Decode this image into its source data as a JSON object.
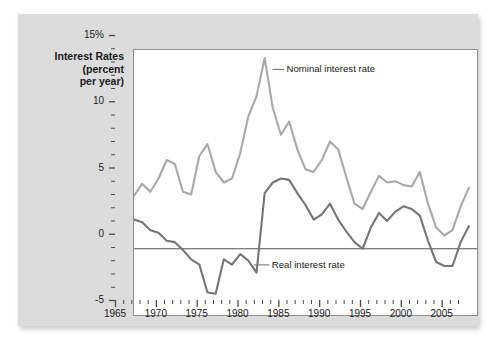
{
  "chart_data": {
    "type": "line",
    "title": "",
    "ylabel": "Interest Rates (percent per year)",
    "ylabel_lines": [
      "Interest Rates",
      "(percent",
      "per year)"
    ],
    "xlabel": "",
    "xlim": [
      1965,
      2007
    ],
    "ylim": [
      -5,
      15
    ],
    "grid": false,
    "legend_position": "inline-annotation",
    "y_ticks": [
      {
        "value": 15,
        "label": "15%"
      },
      {
        "value": 10,
        "label": "10"
      },
      {
        "value": 5,
        "label": "5"
      },
      {
        "value": 0,
        "label": "0"
      },
      {
        "value": -5,
        "label": "-5"
      }
    ],
    "y_minor_tick_step": 1,
    "x_ticks": [
      {
        "value": 1965,
        "label": "1965"
      },
      {
        "value": 1970,
        "label": "1970"
      },
      {
        "value": 1975,
        "label": "1975"
      },
      {
        "value": 1980,
        "label": "1980"
      },
      {
        "value": 1985,
        "label": "1985"
      },
      {
        "value": 1990,
        "label": "1990"
      },
      {
        "value": 1995,
        "label": "1995"
      },
      {
        "value": 2000,
        "label": "2000"
      },
      {
        "value": 2005,
        "label": "2005"
      }
    ],
    "x_minor_tick_step": 1,
    "zero_line": 0,
    "x": [
      1965,
      1966,
      1967,
      1968,
      1969,
      1970,
      1971,
      1972,
      1973,
      1974,
      1975,
      1976,
      1977,
      1978,
      1979,
      1980,
      1981,
      1982,
      1983,
      1984,
      1985,
      1986,
      1987,
      1988,
      1989,
      1990,
      1991,
      1992,
      1993,
      1994,
      1995,
      1996,
      1997,
      1998,
      1999,
      2000,
      2001,
      2002,
      2003,
      2004,
      2005,
      2006
    ],
    "series": [
      {
        "name": "Nominal interest rate",
        "color": "#a9a9a9",
        "values": [
          4.0,
          4.9,
          4.3,
          5.3,
          6.7,
          6.4,
          4.3,
          4.1,
          7.0,
          7.9,
          5.8,
          5.0,
          5.3,
          7.2,
          10.0,
          11.5,
          14.4,
          10.6,
          8.6,
          9.6,
          7.5,
          6.0,
          5.8,
          6.7,
          8.1,
          7.5,
          5.4,
          3.4,
          3.0,
          4.3,
          5.5,
          5.0,
          5.1,
          4.8,
          4.7,
          5.8,
          3.4,
          1.6,
          1.0,
          1.4,
          3.2,
          4.6
        ],
        "label_text": "Nominal interest rate"
      },
      {
        "name": "Real interest rate",
        "color": "#767676",
        "values": [
          2.2,
          2.0,
          1.4,
          1.2,
          0.6,
          0.5,
          -0.1,
          -0.8,
          -1.2,
          -3.3,
          -3.4,
          -0.8,
          -1.2,
          -0.4,
          -0.9,
          -1.8,
          4.2,
          5.0,
          5.3,
          5.2,
          4.2,
          3.3,
          2.2,
          2.6,
          3.4,
          2.2,
          1.3,
          0.5,
          0.0,
          1.6,
          2.7,
          2.1,
          2.8,
          3.2,
          3.0,
          2.5,
          0.6,
          -1.0,
          -1.3,
          -1.3,
          0.5,
          1.7
        ],
        "label_text": "Real interest rate"
      }
    ],
    "annotations": [
      {
        "name": "nominal-annotation",
        "text": "Nominal interest rate",
        "dash_color": "#767676"
      },
      {
        "name": "real-annotation",
        "text": "Real interest rate",
        "dash_color": "#767676"
      }
    ]
  }
}
